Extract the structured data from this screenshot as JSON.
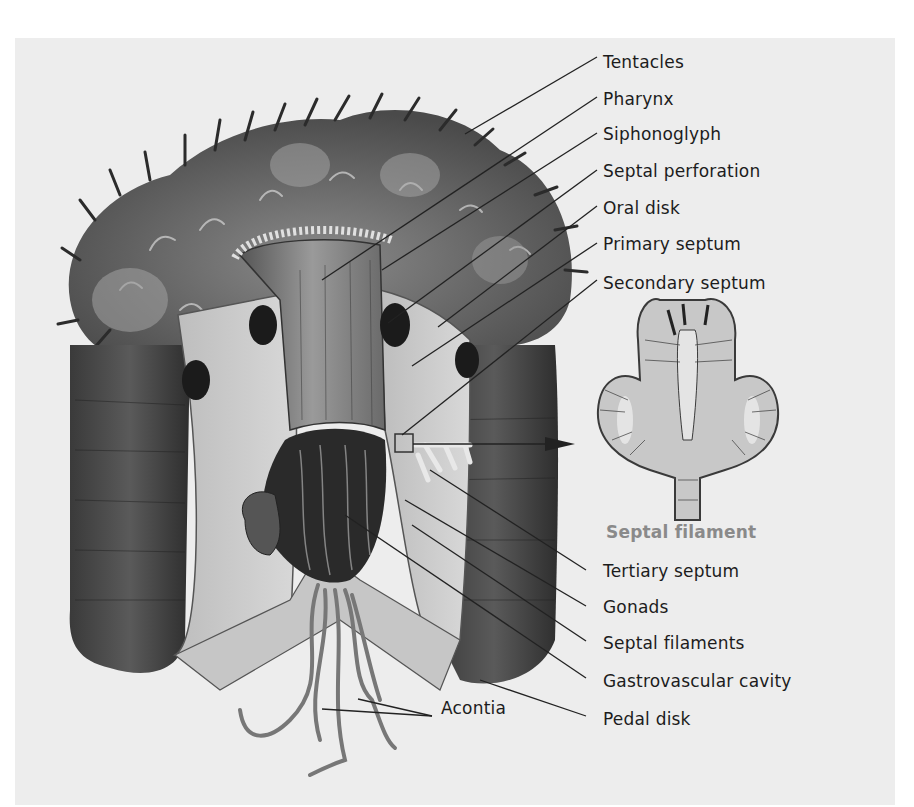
{
  "figure": {
    "background_color": "#ededed",
    "labels_right": [
      {
        "id": "tentacles",
        "text": "Tentacles",
        "x": 603,
        "y": 62
      },
      {
        "id": "pharynx",
        "text": "Pharynx",
        "x": 603,
        "y": 99
      },
      {
        "id": "siphonoglyph",
        "text": "Siphonoglyph",
        "x": 603,
        "y": 134
      },
      {
        "id": "septal-perforation",
        "text": "Septal perforation",
        "x": 603,
        "y": 171
      },
      {
        "id": "oral-disk",
        "text": "Oral disk",
        "x": 603,
        "y": 208
      },
      {
        "id": "primary-septum",
        "text": "Primary septum",
        "x": 603,
        "y": 244
      },
      {
        "id": "secondary-septum",
        "text": "Secondary septum",
        "x": 603,
        "y": 283
      },
      {
        "id": "tertiary-septum",
        "text": "Tertiary septum",
        "x": 603,
        "y": 571
      },
      {
        "id": "gonads",
        "text": "Gonads",
        "x": 603,
        "y": 607
      },
      {
        "id": "septal-filaments",
        "text": "Septal filaments",
        "x": 603,
        "y": 643
      },
      {
        "id": "gastrovascular-cavity",
        "text": "Gastrovascular cavity",
        "x": 603,
        "y": 681
      },
      {
        "id": "pedal-disk",
        "text": "Pedal disk",
        "x": 603,
        "y": 719
      }
    ],
    "label_acontia": {
      "id": "acontia",
      "text": "Acontia",
      "x": 441,
      "y": 708
    },
    "inset": {
      "title": "Septal filament",
      "title_color": "#8a8a8a",
      "x": 606,
      "y": 531
    },
    "leader_lines": [
      {
        "for": "tentacles",
        "x1": 597,
        "y1": 57,
        "x2": 465,
        "y2": 134
      },
      {
        "for": "pharynx",
        "x1": 597,
        "y1": 97,
        "x2": 322,
        "y2": 280
      },
      {
        "for": "siphonoglyph",
        "x1": 597,
        "y1": 133,
        "x2": 382,
        "y2": 270
      },
      {
        "for": "septal-perforation",
        "x1": 597,
        "y1": 170,
        "x2": 388,
        "y2": 323
      },
      {
        "for": "oral-disk",
        "x1": 597,
        "y1": 206,
        "x2": 438,
        "y2": 327
      },
      {
        "for": "primary-septum",
        "x1": 597,
        "y1": 243,
        "x2": 412,
        "y2": 366
      },
      {
        "for": "secondary-septum",
        "x1": 597,
        "y1": 280,
        "x2": 402,
        "y2": 435
      },
      {
        "for": "tertiary-septum",
        "x1": 586,
        "y1": 570,
        "x2": 430,
        "y2": 470
      },
      {
        "for": "gonads",
        "x1": 586,
        "y1": 606,
        "x2": 405,
        "y2": 500
      },
      {
        "for": "septal-filaments",
        "x1": 586,
        "y1": 641,
        "x2": 412,
        "y2": 525
      },
      {
        "for": "gastrovascular-cavity",
        "x1": 586,
        "y1": 678,
        "x2": 345,
        "y2": 515
      },
      {
        "for": "pedal-disk",
        "x1": 586,
        "y1": 716,
        "x2": 480,
        "y2": 680
      }
    ],
    "arrow": {
      "x1": 415,
      "y1": 444,
      "x2": 575,
      "y2": 444
    }
  }
}
